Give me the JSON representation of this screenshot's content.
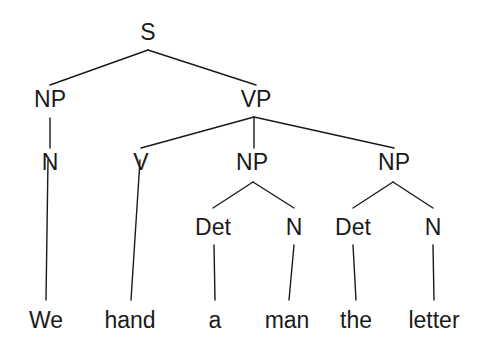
{
  "diagram": {
    "kind": "syntax-parse-tree",
    "sentence": "We hand a man the letter",
    "ink_color": "#1a1a1a",
    "background_color": "#ffffff",
    "nodes": {
      "s": "S",
      "np_subject": "NP",
      "vp": "VP",
      "n_subject": "N",
      "v": "V",
      "np_object1": "NP",
      "np_object2": "NP",
      "det_a": "Det",
      "n_man": "N",
      "det_the": "Det",
      "n_letter": "N"
    },
    "leaves": {
      "we": "We",
      "hand": "hand",
      "a": "a",
      "man": "man",
      "the": "the",
      "letter": "letter"
    }
  }
}
